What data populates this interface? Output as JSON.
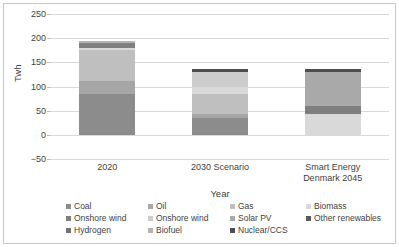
{
  "chart_data": {
    "type": "bar",
    "subtype": "stacked-bar",
    "title": "",
    "xlabel": "Year",
    "ylabel": "Twh",
    "ylim": [
      -50,
      250
    ],
    "yticks": [
      250,
      200,
      150,
      100,
      50,
      0,
      -50
    ],
    "grid": true,
    "legend_position": "bottom",
    "categories": [
      "2020",
      "2030 Scenario",
      "Smart Energy\nDenmark 2045"
    ],
    "category_labels": [
      [
        "2020"
      ],
      [
        "2030 Scenario"
      ],
      [
        "Smart Energy",
        "Denmark 2045"
      ]
    ],
    "series": [
      {
        "name": "Coal",
        "color": "#8c8c8c",
        "pattern": "solid",
        "values": [
          85,
          34,
          0
        ]
      },
      {
        "name": "Oil",
        "color": "#a6a6a6",
        "pattern": "hatch",
        "values": [
          26,
          10,
          0
        ]
      },
      {
        "name": "Gas",
        "color": "#bfbfbf",
        "pattern": "solid",
        "values": [
          65,
          41,
          0
        ]
      },
      {
        "name": "Biomass",
        "color": "#d9d9d9",
        "pattern": "solid",
        "values": [
          3,
          13,
          44
        ]
      },
      {
        "name": "Onshore wind",
        "color": "#7f7f7f",
        "pattern": "solid",
        "values": [
          10,
          0,
          16
        ]
      },
      {
        "name": "Onshore wind",
        "color": "#cccccc",
        "pattern": "solid",
        "values": [
          0,
          31,
          0
        ]
      },
      {
        "name": "Solar PV",
        "color": "#a9a9a9",
        "pattern": "solid",
        "values": [
          0,
          0,
          70
        ]
      },
      {
        "name": "Other renewables",
        "color": "#595959",
        "pattern": "solid",
        "values": [
          0,
          0,
          0
        ]
      },
      {
        "name": "Hydrogen",
        "color": "#737373",
        "pattern": "solid",
        "values": [
          0,
          0,
          0
        ]
      },
      {
        "name": "Biofuel",
        "color": "#b3b3b3",
        "pattern": "solid",
        "values": [
          5,
          0,
          0
        ]
      },
      {
        "name": "Nuclear/CCS",
        "color": "#4d4d4d",
        "pattern": "solid",
        "values": [
          0,
          8,
          7
        ]
      }
    ],
    "totals": [
      194,
      137,
      137
    ]
  },
  "legend": {
    "rows": [
      [
        {
          "label": "Coal",
          "color": "#8c8c8c"
        },
        {
          "label": "Oil",
          "color": "#a6a6a6"
        },
        {
          "label": "Gas",
          "color": "#bfbfbf"
        },
        {
          "label": "Biomass",
          "color": "#d9d9d9"
        }
      ],
      [
        {
          "label": "Onshore wind",
          "color": "#7f7f7f"
        },
        {
          "label": "Onshore wind",
          "color": "#cccccc"
        },
        {
          "label": "Solar PV",
          "color": "#a9a9a9"
        },
        {
          "label": "Other renewables",
          "color": "#595959"
        }
      ],
      [
        {
          "label": "Hydrogen",
          "color": "#737373"
        },
        {
          "label": "Biofuel",
          "color": "#b3b3b3"
        },
        {
          "label": "Nuclear/CCS",
          "color": "#4d4d4d"
        }
      ]
    ]
  }
}
